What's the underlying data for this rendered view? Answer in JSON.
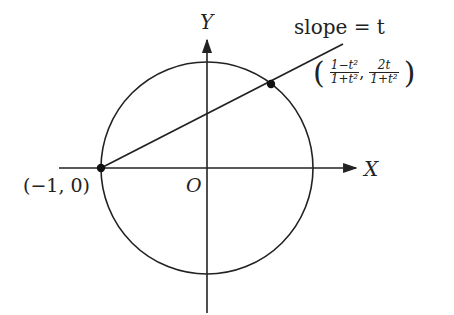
{
  "diagram": {
    "axes": {
      "x_label": "X",
      "y_label": "Y",
      "origin_label": "O"
    },
    "line_label": "slope = t",
    "fixed_point_label": "(−1, 0)",
    "moving_point": {
      "x_num": "1−t²",
      "x_den": "1+t²",
      "y_num": "2t",
      "y_den": "1+t²",
      "separator": ","
    },
    "colors": {
      "stroke": "#222222",
      "background": "#ffffff"
    }
  }
}
